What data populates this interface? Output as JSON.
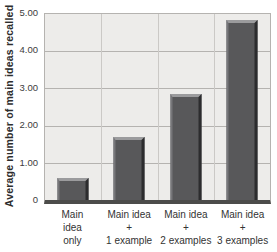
{
  "chart_data": {
    "type": "bar",
    "title": "",
    "xlabel": "",
    "ylabel": "Average number of main ideas recalled",
    "ylim": [
      0,
      5
    ],
    "grid": true,
    "legend": false,
    "yticks": [
      "5.00",
      "4.00",
      "3.00",
      "2.00",
      "1.00",
      "0"
    ],
    "categories": [
      "Main idea only",
      "Main idea + 1 example",
      "Main idea + 2 examples",
      "Main idea + 3 examples"
    ],
    "categories_lines": [
      [
        "Main",
        "idea",
        "only"
      ],
      [
        "Main idea",
        "+",
        "1 example"
      ],
      [
        "Main idea",
        "+",
        "2 examples"
      ],
      [
        "Main idea",
        "+",
        "3 examples"
      ]
    ],
    "values": [
      0.6,
      1.7,
      2.85,
      4.85
    ],
    "colors": {
      "bar_fill": "#58585a",
      "bar_top_highlight": "#9b9b9d",
      "bar_right_shadow": "#2c2c2e",
      "plot_background": "#edecea",
      "gridline": "#b5b3b0",
      "axis": "#4c4c4a",
      "text": "#333333"
    }
  }
}
